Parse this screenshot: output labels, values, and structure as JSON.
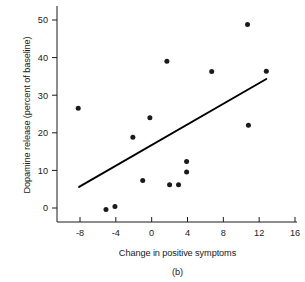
{
  "chart_data": {
    "type": "scatter",
    "title": "",
    "caption": "(b)",
    "xlabel": "Change in positive symptoms",
    "ylabel": "Dopamine release (percent of baseline)",
    "xlim": [
      -11,
      16
    ],
    "ylim": [
      -5,
      53
    ],
    "grid": false,
    "legend": "none",
    "xticks": [
      -8,
      -4,
      0,
      4,
      8,
      12,
      16
    ],
    "xtick_labels": [
      "-8",
      "-4",
      "0",
      "4",
      "8",
      "12",
      "16"
    ],
    "yticks": [
      0,
      10,
      20,
      30,
      40,
      50
    ],
    "ytick_labels": [
      "0",
      "10",
      "20",
      "30",
      "40",
      "50"
    ],
    "points": [
      {
        "x": -8.2,
        "y": 26.5
      },
      {
        "x": -5.1,
        "y": -0.4
      },
      {
        "x": -4.1,
        "y": 0.4
      },
      {
        "x": -2.1,
        "y": 18.8
      },
      {
        "x": -1.0,
        "y": 7.3
      },
      {
        "x": -0.2,
        "y": 24.0
      },
      {
        "x": 1.7,
        "y": 39.0
      },
      {
        "x": 2.0,
        "y": 6.2
      },
      {
        "x": 3.0,
        "y": 6.2
      },
      {
        "x": 3.9,
        "y": 12.4
      },
      {
        "x": 3.9,
        "y": 9.6
      },
      {
        "x": 6.7,
        "y": 36.3
      },
      {
        "x": 10.7,
        "y": 48.8
      },
      {
        "x": 10.8,
        "y": 22.0
      },
      {
        "x": 12.8,
        "y": 36.4
      }
    ],
    "fit_line": {
      "name": "regression line",
      "x0": -8.1,
      "y0": 5.6,
      "x1": 12.8,
      "y1": 34.3
    }
  },
  "colors": {
    "point": "#1a1a1a",
    "line": "#000000",
    "axis": "#1a1a1a",
    "background": "#ffffff"
  }
}
